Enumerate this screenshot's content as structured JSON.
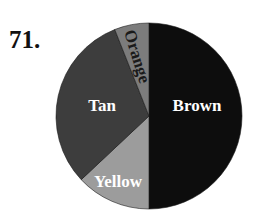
{
  "problem": {
    "number_label": "71."
  },
  "chart_data": {
    "type": "pie",
    "title": "",
    "start_angle_deg": 0,
    "direction": "clockwise",
    "categories": [
      "Brown",
      "Yellow",
      "Tan",
      "Orange"
    ],
    "values": [
      50,
      13,
      31,
      6
    ],
    "unit": "percent (estimated from slice angles)",
    "slices": [
      {
        "label": "Brown",
        "value": 50,
        "color": "#0d0d0d",
        "label_color": "#ffffff"
      },
      {
        "label": "Yellow",
        "value": 13,
        "color": "#9c9c9c",
        "label_color": "#ffffff"
      },
      {
        "label": "Tan",
        "value": 31,
        "color": "#3d3d3d",
        "label_color": "#ffffff"
      },
      {
        "label": "Orange",
        "value": 6,
        "color": "#7c7c7c",
        "label_color": "#1a1a1a"
      }
    ],
    "legend": "none (labels drawn inside slices)"
  },
  "colors": {
    "background": "#ffffff",
    "text_dark": "#111111"
  }
}
